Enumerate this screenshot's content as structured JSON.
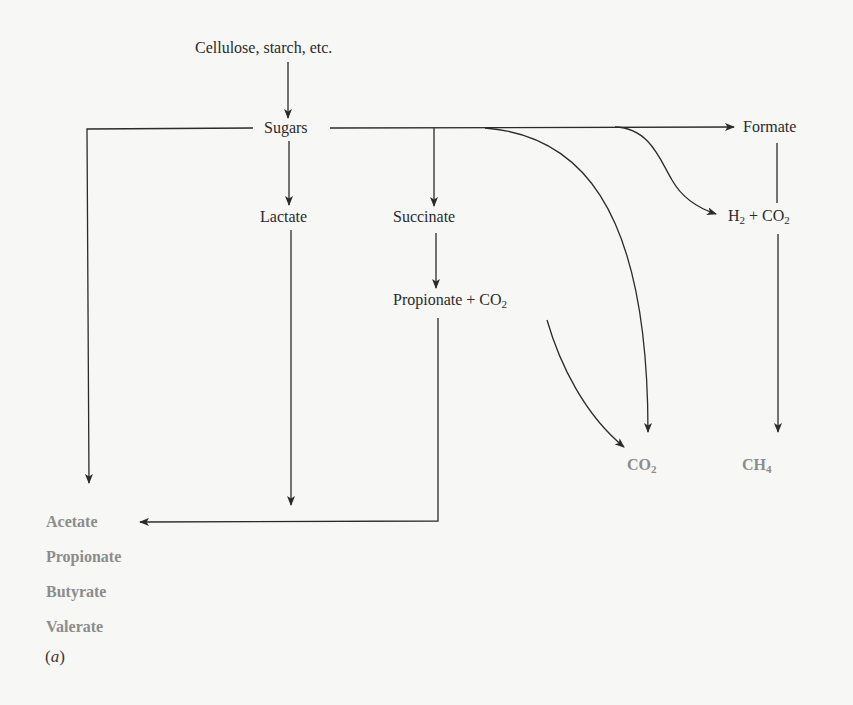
{
  "diagram": {
    "nodes": {
      "substrate": "Cellulose, starch, etc.",
      "sugars": "Sugars",
      "lactate": "Lactate",
      "succinate": "Succinate",
      "propionate_co2": {
        "main": "Propionate + CO",
        "sub": "2"
      },
      "formate": "Formate",
      "h2_co2": {
        "h": "H",
        "h_sub": "2",
        "mid": " + CO",
        "co_sub": "2"
      },
      "co2": {
        "main": "CO",
        "sub": "2"
      },
      "ch4": {
        "main": "CH",
        "sub": "4"
      }
    },
    "end_products": [
      "Acetate",
      "Propionate",
      "Butyrate",
      "Valerate"
    ],
    "panel_label": {
      "open": "(",
      "letter": "a",
      "close": ")"
    },
    "edges": [
      {
        "from": "Cellulose, starch, etc.",
        "to": "Sugars"
      },
      {
        "from": "Sugars",
        "to": "Acetate/Propionate/Butyrate/Valerate"
      },
      {
        "from": "Sugars",
        "to": "Lactate"
      },
      {
        "from": "Sugars",
        "to": "Succinate"
      },
      {
        "from": "Sugars",
        "to": "CO2"
      },
      {
        "from": "Sugars",
        "to": "H2 + CO2"
      },
      {
        "from": "Sugars",
        "to": "Formate"
      },
      {
        "from": "Lactate",
        "to": "Acetate/Propionate/Butyrate/Valerate"
      },
      {
        "from": "Succinate",
        "to": "Propionate + CO2"
      },
      {
        "from": "Propionate + CO2",
        "to": "CO2"
      },
      {
        "from": "Propionate + CO2",
        "to": "Acetate/Propionate/Butyrate/Valerate"
      },
      {
        "from": "Formate",
        "to": "H2 + CO2"
      },
      {
        "from": "H2 + CO2",
        "to": "CH4"
      }
    ],
    "colors": {
      "background": "#f7f7f6",
      "line": "#2b2b2b",
      "text": "#2b2b2b",
      "product_text": "#8c8c8c"
    }
  }
}
